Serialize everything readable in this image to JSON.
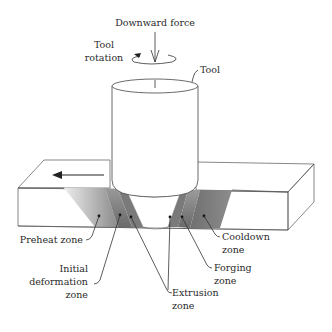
{
  "labels": {
    "downward_force": "Downward force",
    "tool_rotation_1": "Tool",
    "tool_rotation_2": "rotation",
    "tool": "Tool",
    "preheat": "Preheat zone",
    "initial_1": "Initial",
    "initial_2": "deformation",
    "initial_3": "zone",
    "extrusion_1": "Extrusion",
    "extrusion_2": "zone",
    "forging_1": "Forging",
    "forging_2": "zone",
    "cooldown_1": "Cooldown",
    "cooldown_2": "zone"
  },
  "icons": {
    "down_arrow": "downward-force-arrow",
    "rotation": "rotation-arrow",
    "travel": "travel-direction-arrow"
  },
  "colors": {
    "zone_dark": "#6e6e6e",
    "zone_mid": "#9a9a9a",
    "zone_light": "#d8d8d8",
    "line": "#333333"
  }
}
